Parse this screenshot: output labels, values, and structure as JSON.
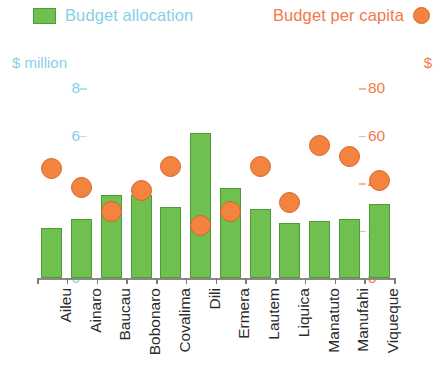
{
  "legend": {
    "series_green_label": "Budget allocation",
    "series_green_color": "#6fc04f",
    "series_orange_label": "Budget per capita",
    "series_orange_color": "#f4833f",
    "swatch_icon": "green-square-swatch",
    "dot_icon": "orange-circle-swatch"
  },
  "axes": {
    "left_title": "$ million",
    "right_title": "$",
    "left_ticks": [
      "0",
      "2",
      "4",
      "6",
      "8"
    ],
    "right_ticks": [
      "0",
      "20",
      "40",
      "60",
      "80"
    ],
    "left_color": "#86cfe8",
    "right_color": "#f4784a"
  },
  "chart_data": {
    "type": "bar",
    "title": "",
    "xlabel": "",
    "ylabel": "$ million",
    "y2label": "$",
    "ylim": [
      0,
      8
    ],
    "y2lim": [
      0,
      80
    ],
    "grid": false,
    "legend_position": "top",
    "categories": [
      "Aileu",
      "Ainaro",
      "Baucau",
      "Bobonaro",
      "Covalima",
      "Dili",
      "Ermera",
      "Lautem",
      "Liquica",
      "Manatuto",
      "Manufahi",
      "Viqueque"
    ],
    "series": [
      {
        "name": "Budget allocation",
        "type": "bar",
        "axis": "left",
        "unit": "$ million",
        "color": "#6fc04f",
        "values": [
          2.1,
          2.5,
          3.5,
          3.5,
          3.0,
          6.1,
          3.8,
          2.9,
          2.3,
          2.4,
          2.5,
          3.1
        ]
      },
      {
        "name": "Budget per capita",
        "type": "scatter",
        "axis": "right",
        "unit": "$",
        "color": "#f4833f",
        "values": [
          46,
          38,
          28,
          37,
          47,
          22,
          28,
          47,
          32,
          56,
          51,
          41
        ]
      }
    ]
  }
}
